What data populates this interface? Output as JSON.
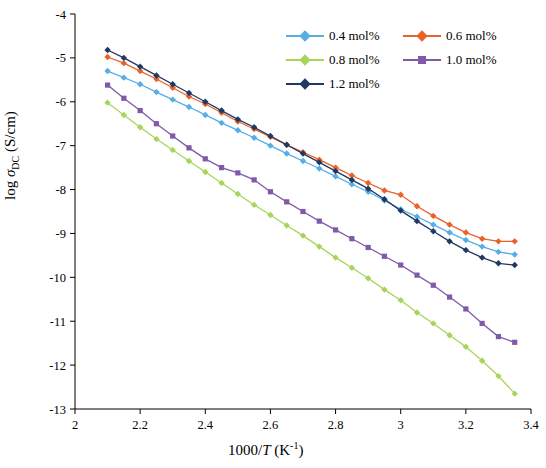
{
  "chart_data": {
    "type": "line",
    "title": "",
    "xlabel": "1000/T (K⁻¹)",
    "ylabel": "log σDC (S/cm)",
    "xlim": [
      2.0,
      3.4
    ],
    "ylim": [
      -13,
      -4
    ],
    "xticks": [
      "2",
      "2.2",
      "2.4",
      "2.6",
      "2.8",
      "3",
      "3.2",
      "3.4"
    ],
    "xtick_values": [
      2.0,
      2.2,
      2.4,
      2.6,
      2.8,
      3.0,
      3.2,
      3.4
    ],
    "yticks": [
      "-13",
      "-12",
      "-11",
      "-10",
      "-9",
      "-8",
      "-7",
      "-6",
      "-5",
      "-4"
    ],
    "ytick_values": [
      -13,
      -12,
      -11,
      -10,
      -9,
      -8,
      -7,
      -6,
      -5,
      -4
    ],
    "grid": false,
    "legend_position": "top-right",
    "series": [
      {
        "name": "0.4 mol%",
        "color": "#55AEE5",
        "marker": "diamond",
        "x": [
          2.1,
          2.15,
          2.2,
          2.25,
          2.3,
          2.35,
          2.4,
          2.45,
          2.5,
          2.55,
          2.6,
          2.65,
          2.7,
          2.75,
          2.8,
          2.85,
          2.9,
          2.95,
          3.0,
          3.05,
          3.1,
          3.15,
          3.2,
          3.25,
          3.3,
          3.35
        ],
        "y": [
          -5.3,
          -5.45,
          -5.6,
          -5.78,
          -5.95,
          -6.12,
          -6.3,
          -6.48,
          -6.65,
          -6.82,
          -7.0,
          -7.18,
          -7.35,
          -7.52,
          -7.7,
          -7.88,
          -8.05,
          -8.25,
          -8.45,
          -8.62,
          -8.8,
          -8.98,
          -9.15,
          -9.3,
          -9.42,
          -9.48
        ]
      },
      {
        "name": "0.6 mol%",
        "color": "#E8622A",
        "marker": "diamond",
        "x": [
          2.1,
          2.15,
          2.2,
          2.25,
          2.3,
          2.35,
          2.4,
          2.45,
          2.5,
          2.55,
          2.6,
          2.65,
          2.7,
          2.75,
          2.8,
          2.85,
          2.9,
          2.95,
          3.0,
          3.05,
          3.1,
          3.15,
          3.2,
          3.25,
          3.3,
          3.35
        ],
        "y": [
          -4.98,
          -5.12,
          -5.3,
          -5.48,
          -5.68,
          -5.88,
          -6.05,
          -6.25,
          -6.45,
          -6.62,
          -6.8,
          -6.98,
          -7.15,
          -7.32,
          -7.5,
          -7.68,
          -7.85,
          -8.02,
          -8.12,
          -8.38,
          -8.6,
          -8.8,
          -8.98,
          -9.12,
          -9.18,
          -9.18
        ]
      },
      {
        "name": "0.8 mol%",
        "color": "#A8D45C",
        "marker": "diamond",
        "x": [
          2.1,
          2.15,
          2.2,
          2.25,
          2.3,
          2.35,
          2.4,
          2.45,
          2.5,
          2.55,
          2.6,
          2.65,
          2.7,
          2.75,
          2.8,
          2.85,
          2.9,
          2.95,
          3.0,
          3.05,
          3.1,
          3.15,
          3.2,
          3.25,
          3.3,
          3.35
        ],
        "y": [
          -6.02,
          -6.3,
          -6.58,
          -6.85,
          -7.1,
          -7.35,
          -7.6,
          -7.85,
          -8.1,
          -8.35,
          -8.58,
          -8.82,
          -9.05,
          -9.3,
          -9.55,
          -9.78,
          -10.02,
          -10.28,
          -10.52,
          -10.8,
          -11.05,
          -11.32,
          -11.58,
          -11.9,
          -12.25,
          -12.65
        ]
      },
      {
        "name": "1.0 mol%",
        "color": "#8059A8",
        "marker": "square",
        "x": [
          2.1,
          2.15,
          2.2,
          2.25,
          2.3,
          2.35,
          2.4,
          2.45,
          2.5,
          2.55,
          2.6,
          2.65,
          2.7,
          2.75,
          2.8,
          2.85,
          2.9,
          2.95,
          3.0,
          3.05,
          3.1,
          3.15,
          3.2,
          3.25,
          3.3,
          3.35
        ],
        "y": [
          -5.62,
          -5.92,
          -6.2,
          -6.5,
          -6.78,
          -7.05,
          -7.3,
          -7.5,
          -7.62,
          -7.78,
          -8.05,
          -8.28,
          -8.5,
          -8.72,
          -8.92,
          -9.12,
          -9.32,
          -9.52,
          -9.72,
          -9.95,
          -10.18,
          -10.45,
          -10.72,
          -11.05,
          -11.35,
          -11.48
        ]
      },
      {
        "name": "1.2 mol%",
        "color": "#203864",
        "marker": "diamond",
        "x": [
          2.1,
          2.15,
          2.2,
          2.25,
          2.3,
          2.35,
          2.4,
          2.45,
          2.5,
          2.55,
          2.6,
          2.65,
          2.7,
          2.75,
          2.8,
          2.85,
          2.9,
          2.95,
          3.0,
          3.05,
          3.1,
          3.15,
          3.2,
          3.25,
          3.3,
          3.35
        ],
        "y": [
          -4.82,
          -5.0,
          -5.2,
          -5.4,
          -5.6,
          -5.8,
          -6.0,
          -6.2,
          -6.4,
          -6.58,
          -6.78,
          -6.98,
          -7.18,
          -7.38,
          -7.58,
          -7.78,
          -7.98,
          -8.22,
          -8.48,
          -8.72,
          -8.95,
          -9.18,
          -9.38,
          -9.55,
          -9.68,
          -9.72
        ]
      }
    ]
  },
  "legend": {
    "items": [
      {
        "label": "0.4 mol%",
        "color": "#55AEE5"
      },
      {
        "label": "0.6 mol%",
        "color": "#E8622A"
      },
      {
        "label": "0.8 mol%",
        "color": "#A8D45C"
      },
      {
        "label": "1.0 mol%",
        "color": "#8059A8"
      },
      {
        "label": "1.2 mol%",
        "color": "#203864"
      }
    ]
  },
  "axes": {
    "y_title_main": "log ",
    "y_title_sigma": "σ",
    "y_title_sub": "DC",
    "y_title_unit": " (S/cm)",
    "x_title_pre": "1000/",
    "x_title_t": "T",
    "x_title_unit": " (K",
    "x_title_exp": "-1",
    "x_title_close": ")"
  }
}
